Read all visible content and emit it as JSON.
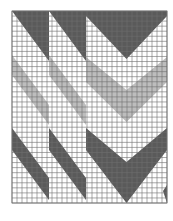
{
  "figure": {
    "type": "grid-pattern-chart",
    "columns": 31,
    "rows": 38,
    "colors": {
      "background": "#ffffff",
      "dark": "#5a5a5a",
      "light": "#bdbdbd",
      "grid": "#6e6e6e"
    },
    "bands": [
      {
        "name": "top-dark-band",
        "color": "dark"
      },
      {
        "name": "middle-light-band",
        "color": "light"
      },
      {
        "name": "bottom-dark-band",
        "color": "dark"
      }
    ],
    "sections": [
      {
        "name": "left-diagonal-section",
        "shape": "diagonal"
      },
      {
        "name": "middle-diagonal-section",
        "shape": "diagonal"
      },
      {
        "name": "right-chevron-section",
        "shape": "chevron"
      }
    ]
  }
}
